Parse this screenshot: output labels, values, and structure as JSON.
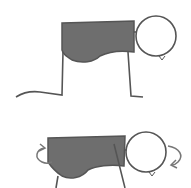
{
  "figures": [
    {
      "name": "pose-1",
      "description": "figure on all fours, head down"
    },
    {
      "name": "pose-2",
      "description": "torso with rotation arrows at both ends"
    }
  ],
  "colors": {
    "body_fill": "#6e6e6e",
    "stroke": "#555555",
    "background": "#ffffff"
  }
}
